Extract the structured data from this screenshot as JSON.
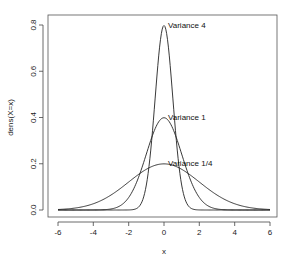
{
  "chart_data": {
    "type": "line",
    "title": "",
    "xlabel": "x",
    "ylabel": "dens(X=x)",
    "xlim": [
      -6,
      6
    ],
    "ylim": [
      0,
      0.8
    ],
    "x_ticks": [
      -6,
      -4,
      -2,
      0,
      2,
      4,
      6
    ],
    "y_ticks": [
      0.0,
      0.2,
      0.4,
      0.6,
      0.8
    ],
    "x_tick_labels": [
      "-6",
      "-4",
      "-2",
      "0",
      "2",
      "4",
      "6"
    ],
    "y_tick_labels": [
      "0.0",
      "0.2",
      "0.4",
      "0.6",
      "0.8"
    ],
    "grid": false,
    "legend": null,
    "series": [
      {
        "name": "Variance 1/4",
        "distribution": "normal",
        "mean": 0,
        "sd": 2,
        "peak": 0.2
      },
      {
        "name": "Variance 1",
        "distribution": "normal",
        "mean": 0,
        "sd": 1,
        "peak": 0.4
      },
      {
        "name": "Variance 4",
        "distribution": "normal",
        "mean": 0,
        "sd": 0.5,
        "peak": 0.8
      }
    ],
    "annotations": [
      {
        "text": "Variance 4",
        "x": 0.2,
        "y": 0.79
      },
      {
        "text": "Variance 1",
        "x": 0.2,
        "y": 0.39
      },
      {
        "text": "Variance 1/4",
        "x": 0.2,
        "y": 0.2
      }
    ]
  },
  "labels": {
    "x_axis": "x",
    "y_axis": "dens(X=x)",
    "annotation_var4": "Variance 4",
    "annotation_var1": "Variance 1",
    "annotation_var14": "Variance 1/4",
    "xt0": "-6",
    "xt1": "-4",
    "xt2": "-2",
    "xt3": "0",
    "xt4": "2",
    "xt5": "4",
    "xt6": "6",
    "yt0": "0.0",
    "yt1": "0.2",
    "yt2": "0.4",
    "yt3": "0.6",
    "yt4": "0.8"
  },
  "colors": {
    "line": "#222222",
    "box": "#444444"
  }
}
